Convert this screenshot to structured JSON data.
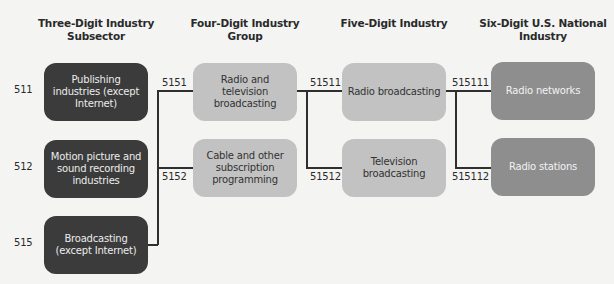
{
  "headers": {
    "col1": "Three-Digit Industry Subsector",
    "col2": "Four-Digit Industry Group",
    "col3": "Five-Digit Industry",
    "col4": "Six-Digit U.S. National Industry"
  },
  "subsectors": [
    {
      "code": "511",
      "label": "Publishing industries (except Internet)"
    },
    {
      "code": "512",
      "label": "Motion picture and sound recording industries"
    },
    {
      "code": "515",
      "label": "Broadcasting (except Internet)"
    }
  ],
  "groups": [
    {
      "code": "5151",
      "label": "Radio and television broadcasting"
    },
    {
      "code": "5152",
      "label": "Cable and other subscription programming"
    }
  ],
  "industries": [
    {
      "code": "51511",
      "label": "Radio broadcasting"
    },
    {
      "code": "51512",
      "label": "Television broadcasting"
    }
  ],
  "national_industries": [
    {
      "code": "515111",
      "label": "Radio networks"
    },
    {
      "code": "515112",
      "label": "Radio stations"
    }
  ],
  "colors": {
    "subsector_box": "#3b3b3b",
    "group_box": "#c2c2c2",
    "industry_box": "#c2c2c2",
    "national_box": "#8e8e8e",
    "connector": "#2f2f2f"
  }
}
